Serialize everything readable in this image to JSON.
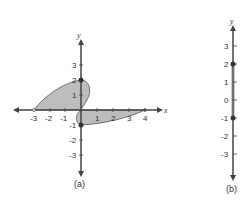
{
  "figure": {
    "panel_a": {
      "caption": "(a)",
      "x_axis_label": "x",
      "y_axis_label": "y",
      "x_ticks": [
        "-3",
        "-2",
        "-1",
        "1",
        "2",
        "3",
        "4"
      ],
      "y_ticks": [
        "3",
        "2",
        "1",
        "-1",
        "-2",
        "-3"
      ],
      "shaded_region": "polar region in plane, upper-left lobe from (-3,0) to (0,2), lower-right lobe from (0,-1) to (4,0)",
      "marked_points": [
        "(0,2)",
        "(0,-1)"
      ]
    },
    "panel_b": {
      "caption": "(b)",
      "axis_label": "y",
      "ticks": [
        "3",
        "2",
        "1",
        "0",
        "-1",
        "-2",
        "-3"
      ],
      "interval": "[-1, 2]",
      "closed_endpoints": [
        "2",
        "-1"
      ]
    },
    "colors": {
      "shade": "#b8b8b8",
      "axis": "#444444",
      "point": "#333333"
    }
  }
}
